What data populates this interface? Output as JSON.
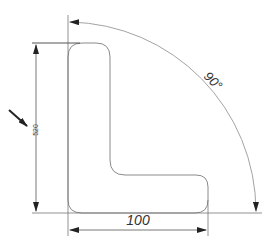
{
  "drawing": {
    "type": "technical-drawing",
    "part": "L-shaped profile",
    "dimensions": {
      "horizontal": {
        "label": "100"
      },
      "vertical": {
        "label": "520"
      },
      "angle": {
        "label": "90°"
      }
    },
    "colors": {
      "outline": "#888888",
      "dimension_line": "#555555",
      "arrow": "#222222",
      "text": "#333333"
    }
  }
}
